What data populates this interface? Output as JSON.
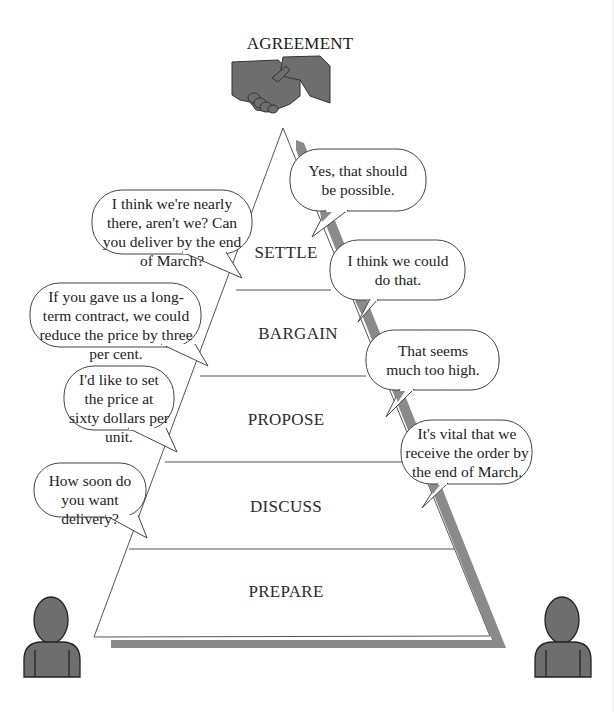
{
  "diagram": {
    "title": "AGREEMENT",
    "stages": [
      {
        "label": "SETTLE"
      },
      {
        "label": "BARGAIN"
      },
      {
        "label": "PROPOSE"
      },
      {
        "label": "DISCUSS"
      },
      {
        "label": "PREPARE"
      }
    ],
    "left_speaker_bubbles": [
      {
        "stage": "SETTLE",
        "text": "I think we're nearly there, aren't we? Can you deliver by the end of March?"
      },
      {
        "stage": "BARGAIN",
        "text": "If you gave us a long-term contract, we could reduce the price by three per cent."
      },
      {
        "stage": "PROPOSE",
        "text": "I'd like to set the price at sixty dollars per unit."
      },
      {
        "stage": "DISCUSS",
        "text": "How soon do you want delivery?"
      }
    ],
    "right_speaker_bubbles": [
      {
        "stage": "SETTLE",
        "text": "Yes, that should be possible."
      },
      {
        "stage": "BARGAIN",
        "text": "I think we could do that."
      },
      {
        "stage": "PROPOSE",
        "text": "That seems much too high."
      },
      {
        "stage": "DISCUSS",
        "text": "It's vital that we receive the order by the end of March."
      }
    ],
    "icons": {
      "top": "handshake-icon",
      "left_person": "person-icon",
      "right_person": "person-icon"
    },
    "colors": {
      "figure_fill": "#6e6e6e",
      "shadow": "#8a8a8a",
      "outline": "#333333",
      "bubble_fill": "#ffffff"
    }
  }
}
